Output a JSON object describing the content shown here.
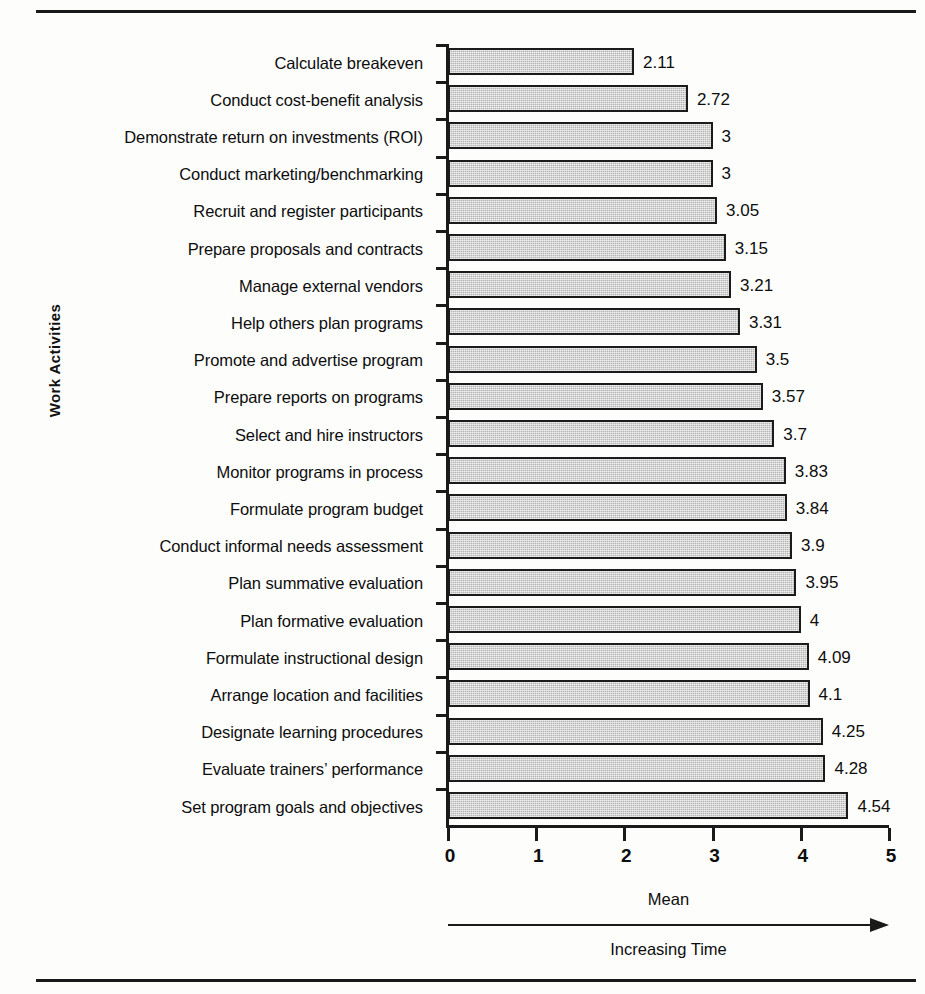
{
  "chart_data": {
    "type": "bar",
    "orientation": "horizontal",
    "title": "",
    "xlabel": "Mean",
    "ylabel": "Work Activities",
    "xlim": [
      0,
      5
    ],
    "xticks": [
      "0",
      "1",
      "2",
      "3",
      "4",
      "5"
    ],
    "grid": false,
    "legend": null,
    "annotation": "Increasing Time",
    "bar_color": "#b4b4b4",
    "bar_border_color": "#1b1b1b",
    "axis_color": "#1a1a1a",
    "categories": [
      "Calculate breakeven",
      "Conduct cost-benefit analysis",
      "Demonstrate return on investments (ROI)",
      "Conduct marketing/benchmarking",
      "Recruit and register participants",
      "Prepare proposals and contracts",
      "Manage external vendors",
      "Help others plan programs",
      "Promote and advertise program",
      "Prepare reports on programs",
      "Select and hire instructors",
      "Monitor programs in process",
      "Formulate program budget",
      "Conduct informal needs assessment",
      "Plan summative evaluation",
      "Plan formative evaluation",
      "Formulate instructional design",
      "Arrange location and facilities",
      "Designate learning procedures",
      "Evaluate trainers’ performance",
      "Set program goals and objectives"
    ],
    "values": [
      2.11,
      2.72,
      3,
      3,
      3.05,
      3.15,
      3.21,
      3.31,
      3.5,
      3.57,
      3.7,
      3.83,
      3.84,
      3.9,
      3.95,
      4,
      4.09,
      4.1,
      4.25,
      4.28,
      4.54
    ],
    "value_labels": [
      "2.11",
      "2.72",
      "3",
      "3",
      "3.05",
      "3.15",
      "3.21",
      "3.31",
      "3.5",
      "3.57",
      "3.7",
      "3.83",
      "3.84",
      "3.9",
      "3.95",
      "4",
      "4.09",
      "4.1",
      "4.25",
      "4.28",
      "4.54"
    ]
  }
}
